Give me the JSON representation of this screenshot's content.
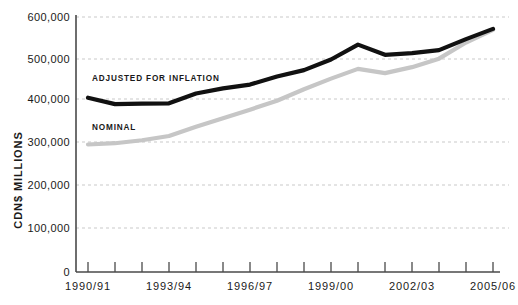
{
  "chart_data": {
    "type": "line",
    "title": "",
    "subtitle": "",
    "xlabel": "",
    "ylabel": "CDN$ MILLIONS",
    "ylim": [
      0,
      600000
    ],
    "ytick_labels": [
      "600,000",
      "500,000",
      "400,000",
      "300,000",
      "200,000",
      "100,000",
      "0"
    ],
    "ytick_values": [
      600000,
      500000,
      400000,
      300000,
      200000,
      100000,
      0
    ],
    "grid": true,
    "legend_position": "inline-annotation",
    "x": [
      "1990/91",
      "1991/92",
      "1992/93",
      "1993/94",
      "1994/95",
      "1995/96",
      "1996/97",
      "1997/98",
      "1998/99",
      "1999/00",
      "2000/01",
      "2001/02",
      "2002/03",
      "2003/04",
      "2004/05",
      "2005/06"
    ],
    "xtick_labels_shown": [
      "1990/91",
      "1993/94",
      "1996/97",
      "1999/00",
      "2002/03",
      "2005/06"
    ],
    "series": [
      {
        "name": "ADJUSTED FOR INFLATION",
        "color": "#111111",
        "values": [
          410000,
          395000,
          396000,
          397000,
          420000,
          432000,
          441000,
          460000,
          475000,
          500000,
          535000,
          511000,
          515000,
          522000,
          548000,
          572000
        ]
      },
      {
        "name": "NOMINAL",
        "color": "#c6c6c6",
        "values": [
          300000,
          303000,
          310000,
          320000,
          342000,
          362000,
          382000,
          403000,
          430000,
          455000,
          478000,
          468000,
          482000,
          502000,
          540000,
          570000
        ]
      }
    ],
    "annotations": [
      {
        "text": "ADJUSTED FOR INFLATION",
        "series": "ADJUSTED FOR INFLATION"
      },
      {
        "text": "NOMINAL",
        "series": "NOMINAL"
      }
    ]
  },
  "axis": {
    "y_title": "CDN$ MILLIONS",
    "y_ticks": [
      {
        "label": "600,000"
      },
      {
        "label": "500,000"
      },
      {
        "label": "400,000"
      },
      {
        "label": "300,000"
      },
      {
        "label": "200,000"
      },
      {
        "label": "100,000"
      },
      {
        "label": "0"
      }
    ],
    "x_ticks": [
      {
        "label": "1990/91"
      },
      {
        "label": "1993/94"
      },
      {
        "label": "1996/97"
      },
      {
        "label": "1999/00"
      },
      {
        "label": "2002/03"
      },
      {
        "label": "2005/06"
      }
    ]
  },
  "labels": {
    "adjusted": "ADJUSTED FOR INFLATION",
    "nominal": "NOMINAL"
  },
  "colors": {
    "adjusted": "#111111",
    "nominal": "#c6c6c6",
    "grid": "#c9c9c9",
    "axis": "#4a4a4a",
    "text": "#1a1a1a",
    "background": "#ffffff"
  }
}
